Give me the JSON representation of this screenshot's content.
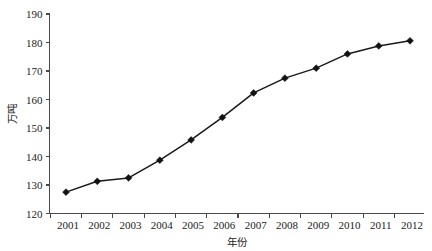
{
  "chart_data": {
    "type": "line",
    "title": "",
    "subtitle": "",
    "xlabel": "年份",
    "ylabel": "万吨",
    "categories": [
      "2001",
      "2002",
      "2003",
      "2004",
      "2005",
      "2006",
      "2007",
      "2008",
      "2009",
      "2010",
      "2011",
      "2012"
    ],
    "x": [
      2001,
      2002,
      2003,
      2004,
      2005,
      2006,
      2007,
      2008,
      2009,
      2010,
      2011,
      2012
    ],
    "values": [
      127.5,
      131.3,
      132.5,
      138.7,
      145.8,
      153.7,
      162.3,
      167.5,
      171.0,
      176.0,
      178.8,
      180.6
    ],
    "series": [
      {
        "name": "",
        "values": [
          127.5,
          131.3,
          132.5,
          138.7,
          145.8,
          153.7,
          162.3,
          167.5,
          171.0,
          176.0,
          178.8,
          180.6
        ],
        "marker": "diamond",
        "color": "#121212"
      }
    ],
    "ylim": [
      120,
      190
    ],
    "ytick_step": 10,
    "yticks": [
      120,
      130,
      140,
      150,
      160,
      170,
      180,
      190
    ],
    "ytick_labels": [
      "120",
      "130",
      "140",
      "150",
      "160",
      "170",
      "180",
      "190"
    ],
    "xtick_labels": [
      "2001",
      "2002",
      "2003",
      "2004",
      "2005",
      "2006",
      "2007",
      "2008",
      "2009",
      "2010",
      "2011",
      "2012"
    ],
    "grid": false,
    "legend": false,
    "legend_position": "none",
    "background_color": "#ffffff",
    "axis_color": "#4a4a4a",
    "line_color": "#1a1a1a",
    "marker_color": "#121212"
  }
}
